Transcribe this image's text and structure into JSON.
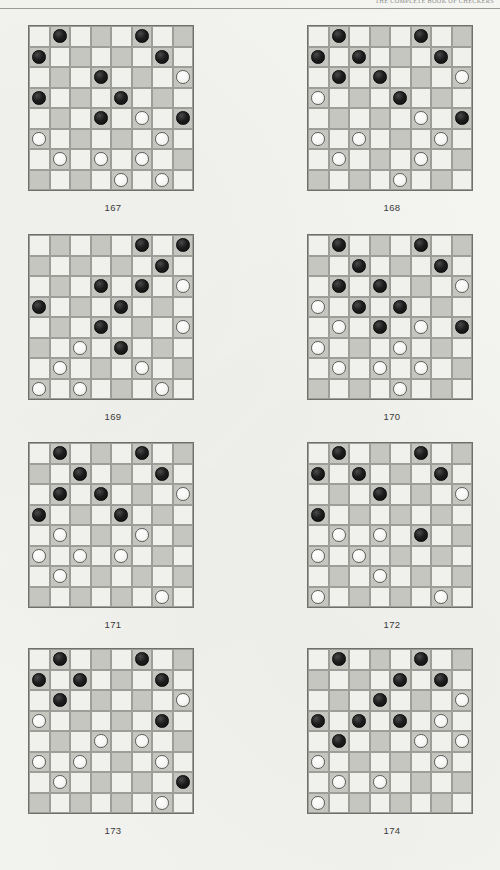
{
  "page": {
    "header_text": "THE COMPLETE BOOK OF CHECKERS",
    "background_color": "#f4f4f1",
    "width": 500,
    "height": 870
  },
  "board_spec": {
    "size": 8,
    "light_square_color": "#f0f0ed",
    "dark_square_color": "#c6c6c1",
    "black_piece_color": "#1c1c1c",
    "white_piece_color": "#f6f6f4",
    "dark_square_rule": "dark when (row + col) is odd"
  },
  "diagrams": [
    {
      "label": "167",
      "position": "row-1 col-left",
      "black": [
        [
          0,
          1
        ],
        [
          0,
          5
        ],
        [
          1,
          0
        ],
        [
          1,
          6
        ],
        [
          2,
          3
        ],
        [
          3,
          0
        ],
        [
          3,
          4
        ],
        [
          4,
          3
        ],
        [
          4,
          7
        ]
      ],
      "white": [
        [
          2,
          7
        ],
        [
          4,
          5
        ],
        [
          5,
          0
        ],
        [
          5,
          6
        ],
        [
          6,
          1
        ],
        [
          6,
          3
        ],
        [
          6,
          5
        ],
        [
          7,
          4
        ],
        [
          7,
          6
        ]
      ]
    },
    {
      "label": "168",
      "position": "row-1 col-right",
      "black": [
        [
          0,
          1
        ],
        [
          0,
          5
        ],
        [
          1,
          0
        ],
        [
          1,
          2
        ],
        [
          1,
          6
        ],
        [
          2,
          1
        ],
        [
          2,
          3
        ],
        [
          3,
          4
        ],
        [
          4,
          7
        ]
      ],
      "white": [
        [
          2,
          7
        ],
        [
          3,
          0
        ],
        [
          4,
          5
        ],
        [
          5,
          0
        ],
        [
          5,
          2
        ],
        [
          5,
          6
        ],
        [
          6,
          1
        ],
        [
          6,
          5
        ],
        [
          7,
          4
        ]
      ]
    },
    {
      "label": "169",
      "position": "row-2 col-left",
      "black": [
        [
          0,
          5
        ],
        [
          0,
          7
        ],
        [
          1,
          6
        ],
        [
          2,
          3
        ],
        [
          2,
          5
        ],
        [
          3,
          0
        ],
        [
          3,
          4
        ],
        [
          4,
          3
        ],
        [
          5,
          4
        ]
      ],
      "white": [
        [
          2,
          7
        ],
        [
          4,
          7
        ],
        [
          5,
          2
        ],
        [
          6,
          1
        ],
        [
          6,
          5
        ],
        [
          7,
          0
        ],
        [
          7,
          2
        ],
        [
          7,
          6
        ]
      ]
    },
    {
      "label": "170",
      "position": "row-2 col-right",
      "black": [
        [
          0,
          1
        ],
        [
          0,
          5
        ],
        [
          1,
          2
        ],
        [
          1,
          6
        ],
        [
          2,
          1
        ],
        [
          2,
          3
        ],
        [
          3,
          2
        ],
        [
          3,
          4
        ],
        [
          4,
          3
        ],
        [
          4,
          7
        ]
      ],
      "white": [
        [
          2,
          7
        ],
        [
          3,
          0
        ],
        [
          4,
          1
        ],
        [
          4,
          5
        ],
        [
          5,
          0
        ],
        [
          5,
          4
        ],
        [
          6,
          1
        ],
        [
          6,
          3
        ],
        [
          6,
          5
        ],
        [
          7,
          4
        ]
      ]
    },
    {
      "label": "171",
      "position": "row-3 col-left",
      "black": [
        [
          0,
          1
        ],
        [
          0,
          5
        ],
        [
          1,
          2
        ],
        [
          1,
          6
        ],
        [
          2,
          1
        ],
        [
          2,
          3
        ],
        [
          3,
          0
        ],
        [
          3,
          4
        ]
      ],
      "white": [
        [
          2,
          7
        ],
        [
          4,
          1
        ],
        [
          4,
          5
        ],
        [
          5,
          0
        ],
        [
          5,
          2
        ],
        [
          5,
          4
        ],
        [
          6,
          1
        ],
        [
          7,
          6
        ]
      ]
    },
    {
      "label": "172",
      "position": "row-3 col-right",
      "black": [
        [
          0,
          1
        ],
        [
          0,
          5
        ],
        [
          1,
          0
        ],
        [
          1,
          2
        ],
        [
          1,
          6
        ],
        [
          2,
          3
        ],
        [
          3,
          0
        ],
        [
          4,
          5
        ]
      ],
      "white": [
        [
          2,
          7
        ],
        [
          4,
          1
        ],
        [
          4,
          3
        ],
        [
          5,
          0
        ],
        [
          5,
          2
        ],
        [
          6,
          3
        ],
        [
          7,
          0
        ],
        [
          7,
          6
        ]
      ]
    },
    {
      "label": "173",
      "position": "row-4 col-left",
      "black": [
        [
          0,
          1
        ],
        [
          0,
          5
        ],
        [
          1,
          0
        ],
        [
          1,
          2
        ],
        [
          1,
          6
        ],
        [
          2,
          1
        ],
        [
          3,
          6
        ],
        [
          6,
          7
        ]
      ],
      "white": [
        [
          2,
          7
        ],
        [
          3,
          0
        ],
        [
          4,
          3
        ],
        [
          4,
          5
        ],
        [
          5,
          0
        ],
        [
          5,
          2
        ],
        [
          5,
          6
        ],
        [
          6,
          1
        ],
        [
          7,
          6
        ]
      ]
    },
    {
      "label": "174",
      "position": "row-4 col-right",
      "black": [
        [
          0,
          1
        ],
        [
          0,
          5
        ],
        [
          1,
          4
        ],
        [
          1,
          6
        ],
        [
          2,
          3
        ],
        [
          3,
          0
        ],
        [
          3,
          2
        ],
        [
          3,
          4
        ],
        [
          4,
          1
        ]
      ],
      "white": [
        [
          2,
          7
        ],
        [
          3,
          6
        ],
        [
          4,
          5
        ],
        [
          4,
          7
        ],
        [
          5,
          0
        ],
        [
          5,
          6
        ],
        [
          6,
          1
        ],
        [
          6,
          3
        ],
        [
          7,
          0
        ]
      ]
    }
  ]
}
